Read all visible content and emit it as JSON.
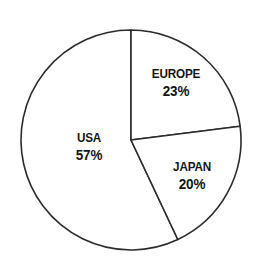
{
  "chart_data": {
    "type": "pie",
    "title": "",
    "subtitle": "",
    "xlabel": "",
    "ylabel": "",
    "grid": false,
    "legend_position": "none",
    "units": "percent",
    "start_angle_deg": 0,
    "direction": "clockwise",
    "categories": [
      "USA",
      "EUROPE",
      "JAPAN"
    ],
    "values": [
      57,
      23,
      20
    ],
    "slices": [
      {
        "label": "USA",
        "value": 57,
        "value_text": "57%",
        "start_deg": 154.8,
        "end_deg": 360,
        "fill": "#ffffff",
        "stroke": "#2b2b2b"
      },
      {
        "label": "EUROPE",
        "value": 23,
        "value_text": "23%",
        "start_deg": 0,
        "end_deg": 82.8,
        "fill": "#ffffff",
        "stroke": "#2b2b2b"
      },
      {
        "label": "JAPAN",
        "value": 20,
        "value_text": "20%",
        "start_deg": 82.8,
        "end_deg": 154.8,
        "fill": "#ffffff",
        "stroke": "#2b2b2b"
      }
    ],
    "geometry": {
      "center_x": 131,
      "center_y": 140,
      "radius": 110
    },
    "colors": {
      "background": "#ffffff",
      "outline": "#2b2b2b",
      "text": "#141414"
    }
  }
}
